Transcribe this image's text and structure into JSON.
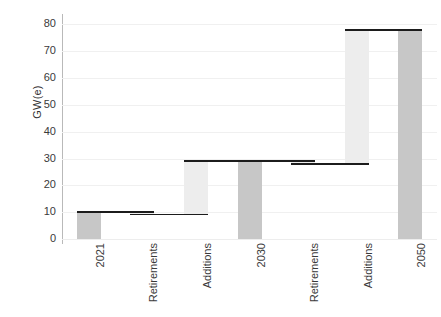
{
  "chart_data": {
    "type": "bar",
    "chart_subtype": "waterfall",
    "title": "",
    "subtitle": "",
    "xlabel": "",
    "ylabel": "GW(e)",
    "ylim": [
      0,
      82
    ],
    "ytick_labels": [
      "0",
      "10",
      "20",
      "30",
      "40",
      "50",
      "60",
      "70",
      "80"
    ],
    "ytick_values": [
      0,
      10,
      20,
      30,
      40,
      50,
      60,
      70,
      80
    ],
    "grid": true,
    "legend": "none",
    "categories": [
      "2021",
      "Retirements",
      "Additions",
      "2030",
      "Retirements",
      "Additions",
      "2050"
    ],
    "values": [
      10,
      -0.8,
      19.8,
      29,
      -1.0,
      50.0,
      78
    ],
    "bar_kinds": [
      "total",
      "delta",
      "delta",
      "total",
      "delta",
      "delta",
      "total"
    ],
    "cumulative_start": [
      0,
      10,
      9.2,
      0,
      29,
      28,
      0
    ],
    "cumulative_end": [
      10,
      9.2,
      29,
      29,
      28,
      78,
      78
    ],
    "connectors": [
      10,
      9.2,
      29,
      29,
      28,
      78
    ],
    "colors": {
      "total_bar": "#c7c7c7",
      "delta_bar": "#ededed",
      "connector": "#1c1c1c",
      "gridline": "#f0f0f0",
      "axis": "#b9b9b9",
      "text": "#3a3a3a",
      "background": "#ffffff"
    }
  }
}
